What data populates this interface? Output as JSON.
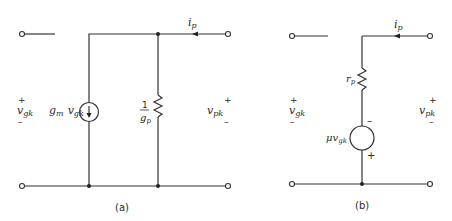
{
  "diagram": {
    "circuit_a": {
      "caption": "(a)",
      "input_plus": "+",
      "input_label": "v",
      "input_sub": "gk",
      "input_minus": "–",
      "source_label_g": "g",
      "source_label_m": "m",
      "source_label_v": "v",
      "source_label_gk": "gk",
      "resistor_num": "1",
      "resistor_den_g": "g",
      "resistor_den_p": "p",
      "current_label": "i",
      "current_sub": "p",
      "output_plus": "+",
      "output_label": "v",
      "output_sub": "pk",
      "output_minus": "–"
    },
    "circuit_b": {
      "caption": "(b)",
      "input_plus": "+",
      "input_label": "v",
      "input_sub": "gk",
      "input_minus": "–",
      "resistor_label": "r",
      "resistor_sub": "p",
      "source_label": "μv",
      "source_sub": "gk",
      "source_minus": "–",
      "source_plus": "+",
      "current_label": "i",
      "current_sub": "p",
      "output_plus": "+",
      "output_label": "v",
      "output_sub": "pk",
      "output_minus": "–"
    }
  }
}
